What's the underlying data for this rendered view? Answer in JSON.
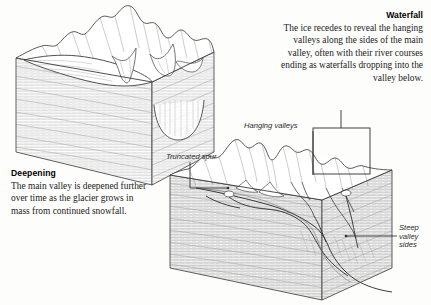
{
  "figure": {
    "ink_color": "#2a2a2a",
    "background": "#fdfdfc"
  },
  "captions": {
    "deepening": {
      "heading": "Deepening",
      "body": "The main valley is deepened further over time as the glacier grows in mass from continued snowfall."
    },
    "waterfall": {
      "heading": "Waterfall",
      "body": "The ice recedes to reveal the hanging valleys along the sides of the main valley, often with their river courses ending as waterfalls dropping into the valley below."
    }
  },
  "annotations": {
    "hanging_valleys": "Hanging valleys",
    "truncated_spur": "Truncated spur",
    "steep_valley_sides": "Steep\nvalley\nsides"
  },
  "diagrams": [
    {
      "name": "upper-left-block",
      "subject": "Glacier-filled valley being deepened",
      "faces": [
        "top-terrain",
        "left-strata-face",
        "right-strata-face"
      ]
    },
    {
      "name": "lower-right-block",
      "subject": "Ice-free glacial trough with hanging valleys",
      "faces": [
        "top-terrain",
        "left-strata-face",
        "right-strata-face"
      ]
    }
  ]
}
